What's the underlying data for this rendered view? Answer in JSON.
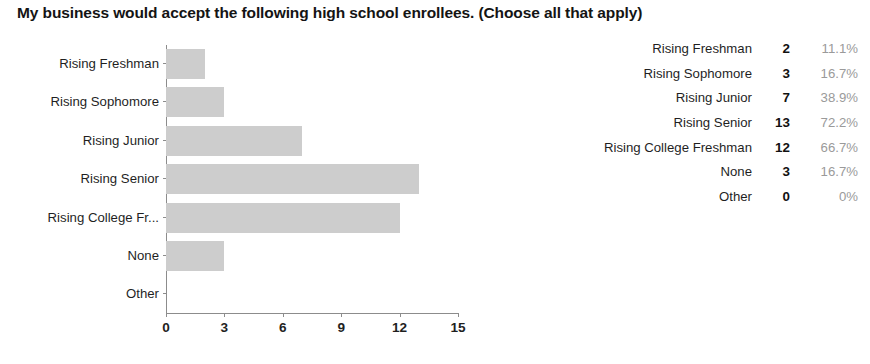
{
  "chart_title": "My business would accept the following high school enrollees. (Choose all that apply)",
  "chart_data": {
    "type": "bar",
    "orientation": "horizontal",
    "title": "My business would accept the following high school enrollees. (Choose all that apply)",
    "xlabel": "",
    "ylabel": "",
    "xlim": [
      0,
      15
    ],
    "xticks": [
      "0",
      "3",
      "6",
      "9",
      "12",
      "15"
    ],
    "grid": false,
    "legend": "none",
    "bar_color": "#cdcdcd",
    "categories": [
      "Rising Freshman",
      "Rising Sophomore",
      "Rising Junior",
      "Rising Senior",
      "Rising College Fr...",
      "None",
      "Other"
    ],
    "values": [
      2,
      3,
      7,
      13,
      12,
      3,
      0
    ]
  },
  "table": {
    "rows": [
      {
        "label": "Rising Freshman",
        "count": "2",
        "percent": "11.1%"
      },
      {
        "label": "Rising Sophomore",
        "count": "3",
        "percent": "16.7%"
      },
      {
        "label": "Rising Junior",
        "count": "7",
        "percent": "38.9%"
      },
      {
        "label": "Rising Senior",
        "count": "13",
        "percent": "72.2%"
      },
      {
        "label": "Rising College Freshman",
        "count": "12",
        "percent": "66.7%"
      },
      {
        "label": "None",
        "count": "3",
        "percent": "16.7%"
      },
      {
        "label": "Other",
        "count": "0",
        "percent": "0%"
      }
    ]
  }
}
